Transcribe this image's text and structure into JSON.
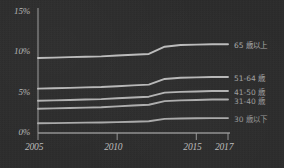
{
  "chart_data": {
    "type": "line",
    "title": "",
    "xlabel": "",
    "ylabel": "",
    "xlim": [
      2005,
      2017
    ],
    "ylim": [
      0,
      15
    ],
    "grid": false,
    "legend_position": "right",
    "x": [
      2005,
      2006,
      2007,
      2008,
      2009,
      2010,
      2011,
      2012,
      2013,
      2014,
      2015,
      2016,
      2017
    ],
    "y_ticks": [
      {
        "value": 0,
        "label": "0%"
      },
      {
        "value": 5,
        "label": "5%"
      },
      {
        "value": 10,
        "label": "10%"
      },
      {
        "value": 15,
        "label": "15%"
      }
    ],
    "x_ticks": [
      {
        "value": 2005,
        "label": "2005"
      },
      {
        "value": 2010,
        "label": "2010"
      },
      {
        "value": 2015,
        "label": "2015"
      },
      {
        "value": 2017,
        "label": "2017"
      }
    ],
    "series": [
      {
        "name": "65 歳以上",
        "color": "#c9c9c9",
        "values": [
          9.3,
          9.35,
          9.4,
          9.45,
          9.5,
          9.6,
          9.7,
          9.8,
          10.7,
          10.9,
          10.95,
          11.0,
          11.0
        ]
      },
      {
        "name": "51-64 歳",
        "color": "#c4c4c4",
        "values": [
          5.5,
          5.55,
          5.6,
          5.65,
          5.7,
          5.8,
          5.9,
          6.0,
          6.7,
          6.85,
          6.9,
          6.95,
          6.95
        ]
      },
      {
        "name": "41-50 歳",
        "color": "#bfbfbf",
        "values": [
          4.0,
          4.05,
          4.1,
          4.15,
          4.2,
          4.3,
          4.4,
          4.5,
          5.0,
          5.1,
          5.15,
          5.2,
          5.2
        ]
      },
      {
        "name": "31-40 歳",
        "color": "#bababa",
        "values": [
          3.0,
          3.05,
          3.1,
          3.15,
          3.2,
          3.3,
          3.4,
          3.5,
          3.95,
          4.05,
          4.1,
          4.15,
          4.15
        ]
      },
      {
        "name": "30 歳以下",
        "color": "#b5b5b5",
        "values": [
          1.2,
          1.22,
          1.25,
          1.28,
          1.3,
          1.35,
          1.4,
          1.45,
          1.75,
          1.8,
          1.82,
          1.85,
          1.85
        ]
      }
    ],
    "axis_color": "#9e9e9e",
    "background_color": "#2c2c2c",
    "text_color": "#bdbdbd"
  }
}
